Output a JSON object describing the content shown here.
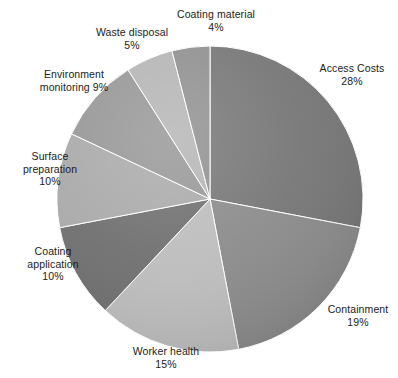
{
  "chart_data": {
    "type": "pie",
    "title": "",
    "subtitle": "",
    "xlabel": "",
    "ylabel": "",
    "legend_position": "none",
    "grid": false,
    "value_unit": "%",
    "start_angle_deg": 0,
    "direction": "clockwise",
    "categories": [
      "Access Costs",
      "Containment",
      "Worker health",
      "Coating application",
      "Surface preparation",
      "Environment monitoring",
      "Waste disposal",
      "Coating material"
    ],
    "values": [
      28,
      19,
      15,
      10,
      10,
      9,
      5,
      4
    ],
    "total": 100,
    "slices": [
      {
        "name": "Access Costs",
        "value": 28,
        "percent_label": "28%",
        "color": "#757575",
        "label_text": "Access Costs\n28%",
        "start_deg": 0,
        "end_deg": 100.8
      },
      {
        "name": "Containment",
        "value": 19,
        "percent_label": "19%",
        "color": "#8a8a8a",
        "label_text": "Containment\n19%",
        "start_deg": 100.8,
        "end_deg": 169.2
      },
      {
        "name": "Worker health",
        "value": 15,
        "percent_label": "15%",
        "color": "#bcbcbc",
        "label_text": "Worker health\n15%",
        "start_deg": 169.2,
        "end_deg": 223.2
      },
      {
        "name": "Coating application",
        "value": 10,
        "percent_label": "10%",
        "color": "#6e6e6e",
        "label_text": "Coating\napplication\n10%",
        "start_deg": 223.2,
        "end_deg": 259.2
      },
      {
        "name": "Surface preparation",
        "value": 10,
        "percent_label": "10%",
        "color": "#a9a9a9",
        "label_text": "Surface\npreparation\n10%",
        "start_deg": 259.2,
        "end_deg": 295.2
      },
      {
        "name": "Environment monitoring",
        "value": 9,
        "percent_label": "9%",
        "color": "#969696",
        "label_text": "Environment\nmonitoring 9%",
        "start_deg": 295.2,
        "end_deg": 327.6
      },
      {
        "name": "Waste disposal",
        "value": 5,
        "percent_label": "5%",
        "color": "#b4b4b4",
        "label_text": "Waste disposal\n5%",
        "start_deg": 327.6,
        "end_deg": 345.6
      },
      {
        "name": "Coating material",
        "value": 4,
        "percent_label": "4%",
        "color": "#8f8f8f",
        "label_text": "Coating material\n4%",
        "start_deg": 345.6,
        "end_deg": 360
      }
    ],
    "geometry": {
      "center_x": 210,
      "center_y": 199,
      "radius": 153
    },
    "colors": {
      "background": "#ffffff",
      "text": "#1a1a1a",
      "edge": "#ffffff"
    }
  }
}
